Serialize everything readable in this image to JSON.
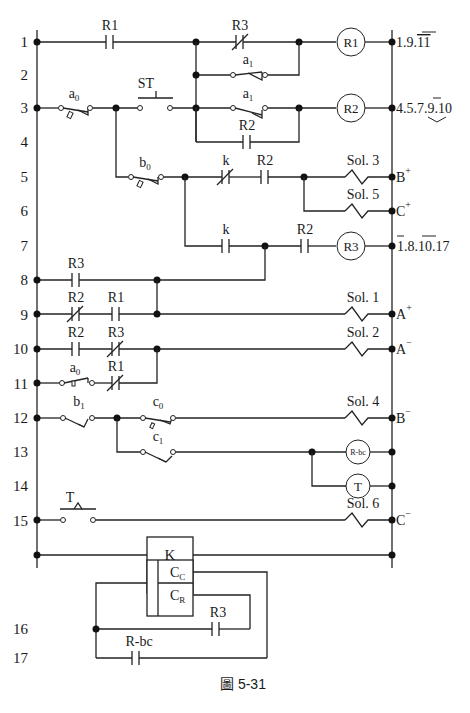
{
  "figure": {
    "caption": "圖 5-31",
    "partial_top_text": "圖5-30"
  },
  "rung_numbers": [
    "1",
    "2",
    "3",
    "4",
    "5",
    "6",
    "7",
    "8",
    "9",
    "10",
    "11",
    "12",
    "13",
    "14",
    "15",
    "16",
    "17"
  ],
  "contacts": {
    "r1_no_row1": "R1",
    "r3_nc_row1": "R3",
    "a1_row2": "a",
    "a1_row2_sub": "1",
    "st_button": "ST",
    "a0_row3": "a",
    "a0_row3_sub": "0",
    "a1_row3": "a",
    "a1_row3_sub": "1",
    "r2_row4": "R2",
    "b0_row5": "b",
    "b0_row5_sub": "0",
    "k_nc_row5": "k",
    "r2_row5": "R2",
    "k_no_row7": "k",
    "r2_row7": "R2",
    "r3_row8": "R3",
    "r2_nc_row9": "R2",
    "r1_row9": "R1",
    "r2_row10": "R2",
    "r3_nc_row10": "R3",
    "a0_row11": "a",
    "a0_row11_sub": "0",
    "r1_nc_row11": "R1",
    "b1_row12": "b",
    "b1_row12_sub": "1",
    "c0_row12": "c",
    "c0_row12_sub": "0",
    "c1_row13": "c",
    "c1_row13_sub": "1",
    "t_row15": "T",
    "r3_row16": "R3",
    "rbc_row17": "R-bc"
  },
  "coils": {
    "r1": "R1",
    "r2": "R2",
    "r3": "R3",
    "rbc": "R-bc",
    "t": "T"
  },
  "solenoids": {
    "sol3": "Sol. 3",
    "sol5": "Sol. 5",
    "sol1": "Sol. 1",
    "sol2": "Sol. 2",
    "sol4": "Sol. 4",
    "sol6": "Sol. 6"
  },
  "right_labels": {
    "row1": {
      "plain": "1.9.",
      "over": "11"
    },
    "row3": {
      "plain_a": "4.5.7.",
      "over": "9",
      "plain_b": ".10"
    },
    "row5": {
      "base": "B",
      "sup": "+"
    },
    "row6": {
      "base": "C",
      "sup": "+"
    },
    "row7": {
      "over_a": "1",
      "plain_a": ".8.",
      "over_b": "10",
      "plain_b": ".17"
    },
    "row9": {
      "base": "A",
      "sup": "+"
    },
    "row10": {
      "base": "A",
      "sup": "−"
    },
    "row12": {
      "base": "B",
      "sup": "−"
    },
    "row15": {
      "base": "C",
      "sup": "−"
    }
  },
  "counter_block": {
    "title": "K",
    "cc_base": "C",
    "cc_sub": "C",
    "cr_base": "C",
    "cr_sub": "R"
  }
}
